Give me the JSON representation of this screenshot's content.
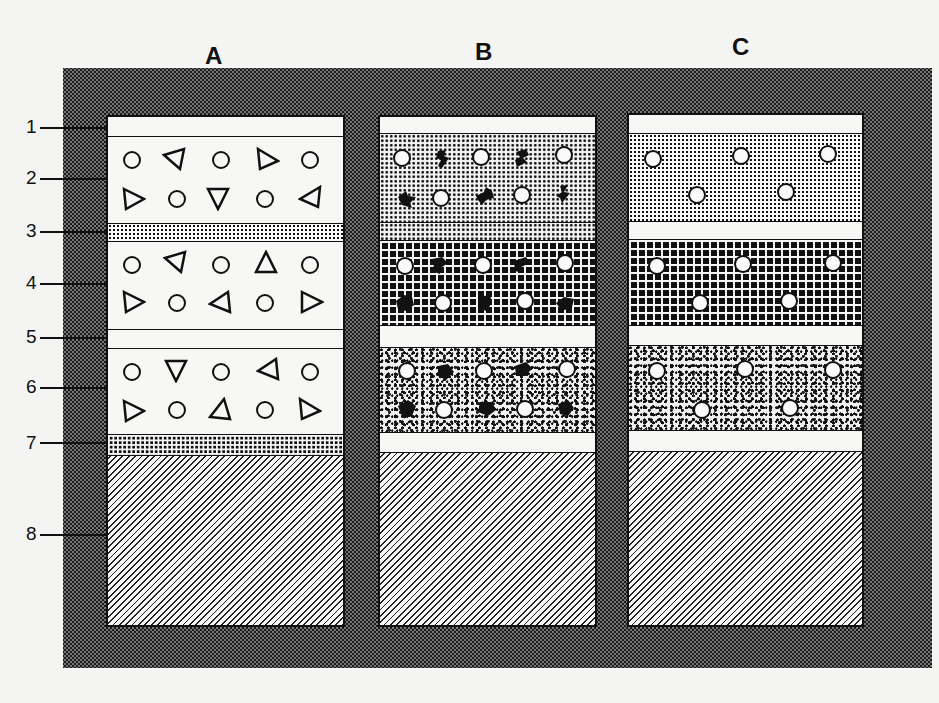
{
  "diagram": {
    "title": "",
    "columns": [
      {
        "id": "A",
        "label": "A"
      },
      {
        "id": "B",
        "label": "B"
      },
      {
        "id": "C",
        "label": "C"
      }
    ],
    "row_labels": [
      "1",
      "2",
      "3",
      "4",
      "5",
      "6",
      "7",
      "8"
    ],
    "layers": {
      "A": [
        "white band",
        "open circles and triangles",
        "dotted grid band",
        "open circles and triangles",
        "white band",
        "open circles and triangles",
        "dense grid band",
        "hatched base"
      ],
      "B": [
        "white band",
        "fine grid with circles and dark blobs",
        "fine grid band",
        "coarse grid with circles and dark blobs",
        "white band",
        "speckled with circles and dark blobs",
        "white band",
        "hatched base"
      ],
      "C": [
        "white band",
        "dotted with circles",
        "white band",
        "coarse grid with circles",
        "white band",
        "speckled with circles",
        "white band",
        "hatched base"
      ]
    },
    "colors": {
      "ink": "#111111",
      "paper": "#f4f4f2",
      "frame": "#777777"
    }
  }
}
